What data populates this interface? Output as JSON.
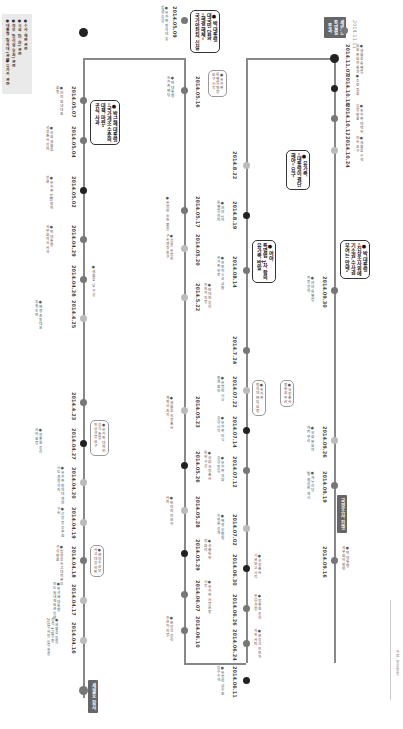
{
  "legend": {
    "items": [
      "● 대통령 (청와대) 관련",
      "● 정부 (총리실·부처) 관련",
      "● 국회 (여·야) 관련",
      "● 수사·재판 관련",
      "● 유가족 관련"
    ],
    "source_label": "자료: 언론종합"
  },
  "colors": {
    "line": "#888888",
    "dot_black": "#222222",
    "dot_gray": "#777777",
    "dot_light": "#bbbbbb",
    "tag_bg": "#666666"
  },
  "tags": {
    "start": "세월호 참사",
    "middle": "국정조사 진행",
    "end": "세월호\n특별법\n통과"
  },
  "end_date": "2014.11.11",
  "column1": [
    {
      "date": "2014.04.16",
      "note": "● 세월호 침몰\n승객 476명 중\n295명 사망, 9명 실종"
    },
    {
      "date": "2014.04.17",
      "note": "● 박근혜 대통령\n진도 실내체육관 방문"
    },
    {
      "date": "2014.04.18",
      "note": "● 범정부사고대책본부\n구성 발표"
    },
    {
      "date": "2014.04.19",
      "note": "● 선장 등 승무원\n구속"
    },
    {
      "date": "2014.04.20",
      "note": "● 유가족 청와대 행진\n시도 경찰 저지"
    },
    {
      "date": "2014.04.27",
      "note": "● 정홍원 총리\n사의 표명"
    },
    {
      "date": "2014.4.23",
      "note": "● 유병언 일가\n수사 착수"
    },
    {
      "date": "2014.4.25",
      "note": "● 해경 초동대처\n부실 논란"
    },
    {
      "date": "2014.04.28",
      "note": "● 세월호 TF 구성"
    },
    {
      "date": "2014.04.29",
      "note": "● 박 대통령\n국무회의서 사과"
    },
    {
      "date": "2014.05.02",
      "note": "● 유가족 KBS 항의\n방문"
    },
    {
      "date": "2014.05.04",
      "note": "● 국회 세월호\n국정조사 합의"
    },
    {
      "date": "2014.05.07",
      "note": "● 여야 원내대표\n회동"
    }
  ],
  "column1_boxes": [
    {
      "text": "● 박근혜 대통령\n\"국가개조 수준의\n대책 마련\"\n공식 사과",
      "style": "dark"
    },
    {
      "text": "● 유가족 대책위\n공식 출범\n진상규명 요구",
      "style": "light"
    },
    {
      "text": "● 해양수산부\n사고 대응 비판",
      "style": "light"
    }
  ],
  "column2": [
    {
      "date": "2014.05.09",
      "note": "● 유가족 청와대 앞\n밤샘 농성"
    },
    {
      "date": "2014.05.16",
      "note": "● 박 대통령\n유가족 면담"
    },
    {
      "date": "2014.05.17",
      "note": "● 유병언 소환 불응"
    },
    {
      "date": "2014.05.20",
      "note": "● 검찰, 유병언\n구속영장 청구"
    },
    {
      "date": "2014.5.22",
      "note": "● 안대희 총리\n후보자 지명"
    },
    {
      "date": "2014.05.23",
      "note": "● 세월호 국정조사\n계획서 처리"
    },
    {
      "date": "2014.05.26",
      "note": "● 국회 국정조사\n특위 구성"
    },
    {
      "date": "2014.05.28",
      "note": "● 안대희 후보자\n사퇴"
    },
    {
      "date": "2014.05.29",
      "note": "● 국조특위\n첫 회의"
    },
    {
      "date": "2014.06.07",
      "note": "● 유가족 서명운동\n시작"
    },
    {
      "date": "2014.06.10",
      "note": "● 문창극 총리\n후보자 지명"
    }
  ],
  "column2_boxes": [
    {
      "text": "● 박 대통령\n대국민 담화\n\"해경 해체\"\n국가안전처 신설",
      "style": "dark"
    },
    {
      "text": "● 유가족\n특별법 제정\n요구 시작",
      "style": "light"
    }
  ],
  "column3": [
    {
      "date": "2014.06.11",
      "note": "● 유병언 금수원\n압수수색"
    },
    {
      "date": "2014.06.24",
      "note": "● 문창극 후보자\n자진 사퇴"
    },
    {
      "date": "2014.06.26",
      "note": "● 정홍원 총리\n유임 결정"
    },
    {
      "date": "2014.06.30",
      "note": "● 국정조사\n기관보고 시작"
    },
    {
      "date": "2014.07.02",
      "note": "● 해경 상황실\n녹취록 공개"
    },
    {
      "date": "2014.07.12",
      "note": "● 유가족 국회\n농성 돌입"
    },
    {
      "date": "2014.07.14",
      "note": "● 유가족 단식\n농성 시작"
    },
    {
      "date": "2014.07.22",
      "note": "● 유병언 시신\n발견 확인"
    },
    {
      "date": "2014.7.24",
      "note": "● 참사 100일\n추모 행진"
    },
    {
      "date": "2014.08.14",
      "note": "● 프란치스코 교황\n유가족 위로"
    },
    {
      "date": "2014.8.19",
      "note": "● 여야 2차\n특별법 합의"
    },
    {
      "date": "2014.8.22",
      "note": "● 유가족 합의안\n거부"
    }
  ],
  "column3_boxes": [
    {
      "text": "● 여야\n특별법 1차 합의\n유가족 반발",
      "style": "dark"
    },
    {
      "text": "● 유가족\n청와대 면담 요청",
      "style": "light"
    },
    {
      "text": "● 국정조사\n청문회 무산",
      "style": "light"
    }
  ],
  "column4": [
    {
      "date": "2014.09.16",
      "note": "● 박 대통령\n국무회의 발언"
    },
    {
      "date": "2014.09.19",
      "note": "● 새누리당\n3차 협상안 제시"
    },
    {
      "date": "2014.09.26",
      "note": "● 국회 본회의\n개최 무산"
    },
    {
      "date": "2014.09.30",
      "note": "● 여야 특별법\n최종 합의"
    },
    {
      "date": "2014.10.24",
      "note": "● 세월호 수색\n지속 요구"
    },
    {
      "date": "2014.10.12",
      "note": "● 유가족 대책위\n입장 발표"
    },
    {
      "date": "2014.10.18",
      "note": "● 추모 집회"
    },
    {
      "date": "2014.11.07",
      "note": "● 세월호 특별법\n국회 본회의 통과"
    }
  ],
  "column4_boxes": [
    {
      "text": "● 박 대통령\n\"진상조사위에\n기소권·수사권\n부여는 안돼\"",
      "style": "dark"
    },
    {
      "text": "● 유가족\n\"대통령이 결단\n해야\" 요구",
      "style": "dark"
    }
  ]
}
